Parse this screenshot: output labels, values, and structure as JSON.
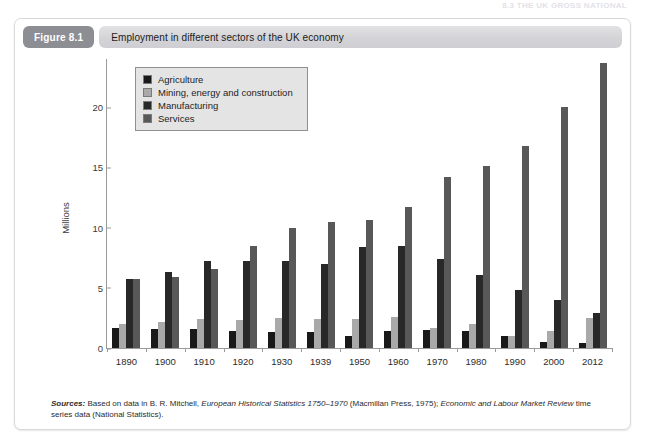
{
  "running_head": "8.3 THE UK GROSS NATIONAL",
  "figure": {
    "tag": "Figure 8.1",
    "title": "Employment in different sectors of the UK economy"
  },
  "sources": {
    "label": "Sources:",
    "line1_a": " Based on data in B. R. Mitchell, ",
    "line1_italic": "European Historical Statistics 1750–1970",
    "line1_b": " (Macmillan Press, 1975); ",
    "line1_italic2": "Economic and Labour Market",
    "line2_italic": "Review",
    "line2_b": " time series data (National Statistics)."
  },
  "chart_data": {
    "type": "bar",
    "title": "Employment in different sectors of the UK economy",
    "xlabel": "",
    "ylabel": "Millions",
    "ylim": [
      0,
      24
    ],
    "yticks": [
      0,
      5,
      10,
      15,
      20
    ],
    "grid": false,
    "legend_position": "top-left",
    "categories": [
      "1890",
      "1900",
      "1910",
      "1920",
      "1930",
      "1939",
      "1950",
      "1960",
      "1970",
      "1980",
      "1990",
      "2000",
      "2012"
    ],
    "series": [
      {
        "name": "Agriculture",
        "color": "#191919",
        "values": [
          1.7,
          1.6,
          1.6,
          1.4,
          1.3,
          1.3,
          1.0,
          1.4,
          1.5,
          1.4,
          1.0,
          0.5,
          0.4
        ]
      },
      {
        "name": "Mining, energy and construction",
        "color": "#a9a9a9",
        "values": [
          2.0,
          2.2,
          2.4,
          2.3,
          2.5,
          2.4,
          2.4,
          2.6,
          1.7,
          2.0,
          1.0,
          1.4,
          2.5
        ]
      },
      {
        "name": "Manufacturing",
        "color": "#282828",
        "values": [
          5.7,
          6.3,
          7.2,
          7.2,
          7.2,
          7.0,
          8.4,
          8.5,
          7.4,
          6.1,
          4.8,
          4.0,
          2.9
        ]
      },
      {
        "name": "Services",
        "color": "#585858",
        "values": [
          5.7,
          5.9,
          6.6,
          8.5,
          10.0,
          10.5,
          10.6,
          11.7,
          14.2,
          15.1,
          16.8,
          20.0,
          23.7
        ]
      }
    ]
  }
}
